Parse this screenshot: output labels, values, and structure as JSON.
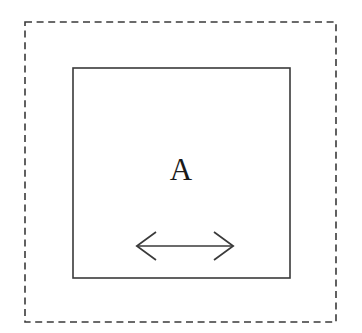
{
  "figure": {
    "background_color": "#ffffff",
    "stroke_color": "#3a3a3a",
    "label_color": "#1a1a1a",
    "canvas": {
      "width": 362,
      "height": 333
    },
    "outer_boundary": {
      "name": "dashed-boundary",
      "style": "dashed",
      "x": 25,
      "y": 22,
      "width": 311,
      "height": 300,
      "dash_length": 7,
      "gap_length": 4.6,
      "stroke_width": 1.6
    },
    "inner_region": {
      "name": "solid-region",
      "style": "solid",
      "label": "A",
      "x": 73,
      "y": 68,
      "width": 217,
      "height": 210,
      "stroke_width": 1.6,
      "fill": "#ffffff"
    },
    "region_label": {
      "text": "A",
      "x": 181,
      "baseline_y": 180,
      "font_size": 31
    },
    "dimension_arrow": {
      "name": "double-headed-arrow",
      "orientation": "horizontal",
      "double_headed": true,
      "line_y": 246,
      "x_start": 136,
      "x_end": 234,
      "length": 98,
      "head_length": 20,
      "head_half_height": 14,
      "stroke_width": 1.7,
      "left_head_path": "M 156 232 L 136.8 246 L 156 260",
      "right_head_path": "M 214 232 L 233.2 246 L 214 260",
      "shaft_path": "M 136.8 246 L 233.2 246"
    }
  }
}
